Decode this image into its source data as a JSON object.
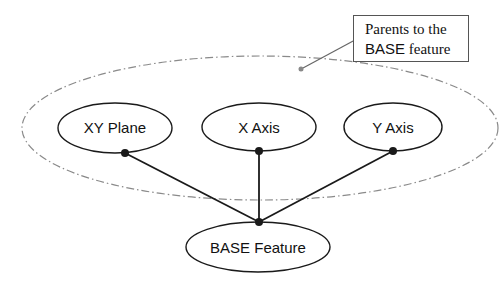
{
  "diagram": {
    "type": "parent-child feature dependency",
    "callout": {
      "line1": "Parents to the",
      "line2_part1": "BASE",
      "line2_part2": " feature"
    },
    "group": {
      "label": "Parents to the BASE feature",
      "style": "dash-dot ellipse"
    },
    "nodes": [
      {
        "id": "xy-plane",
        "label": "XY Plane",
        "role": "parent"
      },
      {
        "id": "x-axis",
        "label": "X Axis",
        "role": "parent"
      },
      {
        "id": "y-axis",
        "label": "Y Axis",
        "role": "parent"
      },
      {
        "id": "base-feature",
        "label": "BASE Feature",
        "role": "child"
      }
    ],
    "edges": [
      {
        "from": "xy-plane",
        "to": "base-feature"
      },
      {
        "from": "x-axis",
        "to": "base-feature"
      },
      {
        "from": "y-axis",
        "to": "base-feature"
      }
    ],
    "colors": {
      "stroke": "#1a1a1a",
      "group_stroke": "#8a8a8a",
      "background": "#ffffff"
    }
  }
}
